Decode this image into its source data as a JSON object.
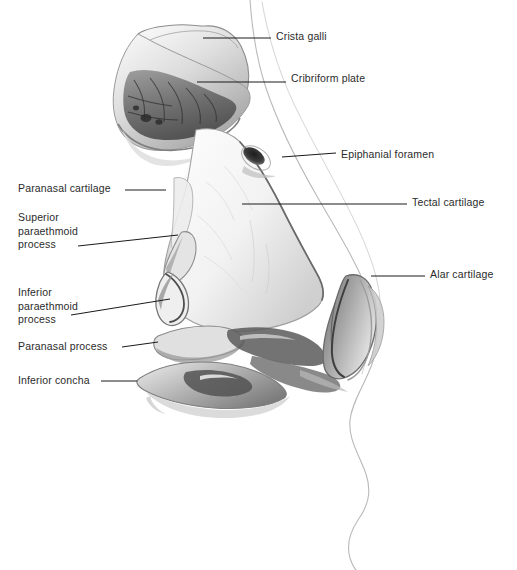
{
  "figure": {
    "medium": "grayscale wash illustration",
    "background_color": "#ffffff",
    "ink_color": "#2b2b2b",
    "leader_color": "#1a1a1a",
    "wash_light": "#f2f2f2",
    "wash_mid": "#c9c9c9",
    "wash_dark": "#6e6e6e",
    "wash_darkest": "#3a3a3a"
  },
  "labels": [
    {
      "id": "crista-galli",
      "text": "Crista galli",
      "side": "right",
      "text_x": 276,
      "text_y": 30,
      "leader": {
        "x1": 203,
        "y1": 38,
        "x2": 271,
        "y2": 38
      }
    },
    {
      "id": "cribriform-plate",
      "text": "Cribriform plate",
      "side": "right",
      "text_x": 291,
      "text_y": 72,
      "leader": {
        "x1": 197,
        "y1": 82,
        "x2": 286,
        "y2": 82
      }
    },
    {
      "id": "epiphanial-foramen",
      "text": "Epiphanial foramen",
      "side": "right",
      "text_x": 341,
      "text_y": 148,
      "leader": {
        "x1": 282,
        "y1": 157,
        "x2": 336,
        "y2": 153
      }
    },
    {
      "id": "tectal-cartilage",
      "text": "Tectal cartilage",
      "side": "right",
      "text_x": 412,
      "text_y": 196,
      "leader": {
        "x1": 242,
        "y1": 204,
        "x2": 407,
        "y2": 204
      }
    },
    {
      "id": "alar-cartilage",
      "text": "Alar cartilage",
      "side": "right",
      "text_x": 430,
      "text_y": 268,
      "leader": {
        "x1": 371,
        "y1": 276,
        "x2": 425,
        "y2": 276
      }
    },
    {
      "id": "paranasal-cartilage",
      "text": "Paranasal cartilage",
      "side": "left",
      "text_x": 18,
      "text_y": 182,
      "leader": {
        "x1": 125,
        "y1": 190,
        "x2": 166,
        "y2": 190
      }
    },
    {
      "id": "superior-paraethmoid-process",
      "text": "Superior\nparaethmoid\nprocess",
      "side": "left",
      "text_x": 18,
      "text_y": 211,
      "leader": {
        "x1": 78,
        "y1": 246,
        "x2": 178,
        "y2": 235
      }
    },
    {
      "id": "inferior-paraethmoid-process",
      "text": "Inferior\nparaethmoid\nprocess",
      "side": "left",
      "text_x": 18,
      "text_y": 286,
      "leader": {
        "x1": 71,
        "y1": 315,
        "x2": 170,
        "y2": 299
      }
    },
    {
      "id": "paranasal-process",
      "text": "Paranasal process",
      "side": "left",
      "text_x": 18,
      "text_y": 340,
      "leader": {
        "x1": 122,
        "y1": 347,
        "x2": 158,
        "y2": 342
      }
    },
    {
      "id": "inferior-concha",
      "text": "Inferior concha",
      "side": "left",
      "text_x": 18,
      "text_y": 374,
      "leader": {
        "x1": 101,
        "y1": 381,
        "x2": 137,
        "y2": 381
      }
    }
  ]
}
